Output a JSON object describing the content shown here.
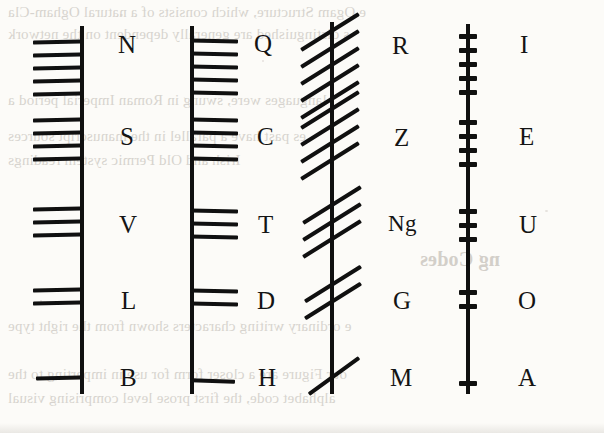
{
  "page": {
    "kind": "scanned-book-figure",
    "ink_color": "#101010",
    "paper_color": "#fcfbf8",
    "bleed_color": "#b9b4ad"
  },
  "bleed_text": {
    "lines": [
      {
        "text": "e Ogam Structure, which consists of a natural Ogham-Cla",
        "x": 8,
        "y": 4,
        "size": 15
      },
      {
        "text": "s distinguished are generally dependent on the network",
        "x": 8,
        "y": 26,
        "size": 15
      },
      {
        "text": "languages were, swung in Roman Imperial period a",
        "x": 8,
        "y": 92,
        "size": 15
      },
      {
        "text": "es past have a parallel in the manuscript sources",
        "x": 8,
        "y": 128,
        "size": 15
      },
      {
        "text": "Irish and Old Permic system readings",
        "x": 8,
        "y": 152,
        "size": 15
      },
      {
        "text": "ng Codes",
        "x": 420,
        "y": 248,
        "size": 20,
        "head": true
      },
      {
        "text": "e ordinary writing characters shown from the right type",
        "x": 8,
        "y": 318,
        "size": 15
      },
      {
        "text": "our Figure are a closer form for use in imparting to the",
        "x": 8,
        "y": 366,
        "size": 15
      },
      {
        "text": "alphabet code, the first prose level comprising visual",
        "x": 8,
        "y": 390,
        "size": 15
      }
    ]
  },
  "chart": {
    "columns": [
      {
        "name": "aicme-beithe",
        "stroke_side": "left",
        "stem_x": 80,
        "letters": [
          "N",
          "S",
          "V",
          "L",
          "B"
        ]
      },
      {
        "name": "aicme-huatha",
        "stroke_side": "right",
        "stem_x": 190,
        "letters": [
          "Q",
          "C",
          "T",
          "D",
          "H"
        ]
      },
      {
        "name": "aicme-muine",
        "stroke_side": "across",
        "stem_x": 330,
        "letters": [
          "R",
          "Z",
          "Ng",
          "G",
          "M"
        ]
      },
      {
        "name": "aicme-ailme",
        "stroke_side": "notch",
        "stem_x": 466,
        "letters": [
          "I",
          "E",
          "U",
          "O",
          "A"
        ]
      }
    ],
    "rows": [
      {
        "index": 1,
        "stroke_count": 5,
        "y": 24,
        "letters": [
          "N",
          "Q",
          "R",
          "I"
        ]
      },
      {
        "index": 2,
        "stroke_count": 4,
        "y": 100,
        "letters": [
          "S",
          "C",
          "Z",
          "E"
        ]
      },
      {
        "index": 3,
        "stroke_count": 3,
        "y": 196,
        "letters": [
          "V",
          "T",
          "Ng",
          "U"
        ]
      },
      {
        "index": 4,
        "stroke_count": 2,
        "y": 278,
        "letters": [
          "L",
          "D",
          "G",
          "O"
        ]
      },
      {
        "index": 5,
        "stroke_count": 1,
        "y": 356,
        "letters": [
          "B",
          "H",
          "M",
          "A"
        ]
      }
    ],
    "labels": {
      "c1r1": "N",
      "c2r1": "Q",
      "c3r1": "R",
      "c4r1": "I",
      "c1r2": "S",
      "c2r2": "C",
      "c3r2": "Z",
      "c4r2": "E",
      "c1r3": "V",
      "c2r3": "T",
      "c3r3": "Ng",
      "c4r3": "U",
      "c1r4": "L",
      "c2r4": "D",
      "c3r4": "G",
      "c4r4": "O",
      "c1r5": "B",
      "c2r5": "H",
      "c3r5": "M",
      "c4r5": "A"
    }
  }
}
